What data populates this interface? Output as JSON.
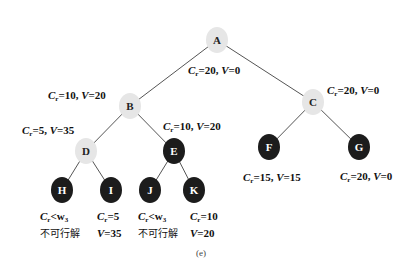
{
  "figure": {
    "caption": "(e)",
    "nodes": [
      {
        "id": "A",
        "style": "light"
      },
      {
        "id": "B",
        "style": "light"
      },
      {
        "id": "C",
        "style": "light"
      },
      {
        "id": "D",
        "style": "light"
      },
      {
        "id": "E",
        "style": "dark"
      },
      {
        "id": "F",
        "style": "dark"
      },
      {
        "id": "G",
        "style": "dark"
      },
      {
        "id": "H",
        "style": "dark"
      },
      {
        "id": "I",
        "style": "dark"
      },
      {
        "id": "J",
        "style": "dark"
      },
      {
        "id": "K",
        "style": "dark"
      }
    ],
    "edges": [
      [
        "A",
        "B"
      ],
      [
        "A",
        "C"
      ],
      [
        "B",
        "D"
      ],
      [
        "B",
        "E"
      ],
      [
        "C",
        "F"
      ],
      [
        "C",
        "G"
      ],
      [
        "D",
        "H"
      ],
      [
        "D",
        "I"
      ],
      [
        "E",
        "J"
      ],
      [
        "E",
        "K"
      ]
    ],
    "labels": {
      "A": {
        "cr": "=20, ",
        "v": "=0"
      },
      "B": {
        "cr": "=10, ",
        "v": "=20"
      },
      "C": {
        "cr": "=20, ",
        "v": "=0"
      },
      "D": {
        "cr": "=5, ",
        "v": "=35"
      },
      "E": {
        "cr": "=10, ",
        "v": "=20"
      },
      "F": {
        "cr": "=15, ",
        "v": "=15"
      },
      "G": {
        "cr": "=20, ",
        "v": "=0"
      },
      "H": {
        "line1": "<w",
        "sub": "3",
        "line2": "不可行解"
      },
      "I": {
        "cr": "=5",
        "v": "=35"
      },
      "J": {
        "line1": "<w",
        "sub": "3",
        "line2": "不可行解"
      },
      "K": {
        "cr": "=10",
        "v": "=20"
      }
    },
    "symbols": {
      "C": "C",
      "r": "r",
      "V": "V"
    }
  }
}
